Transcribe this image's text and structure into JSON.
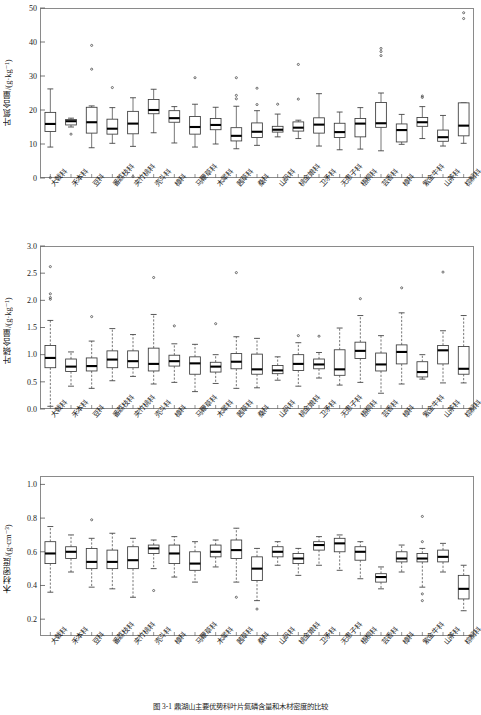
{
  "figure": {
    "caption": "图 3-1  鼎湖山主要优势科叶片氮磷含量和木材密度的比较",
    "categories": [
      "大戟科",
      "禾本科",
      "豆科",
      "番荔枝科",
      "夹竹桃科",
      "壳斗科",
      "樟科",
      "马鞭草科",
      "木犀科",
      "茜草科",
      "桑科",
      "山矾科",
      "桃金娘科",
      "卫矛科",
      "无患子科",
      "梧桐科",
      "芸香科",
      "樟科",
      "紫金牛科",
      "山茶科",
      "棕榈科"
    ]
  },
  "chart_data": [
    {
      "type": "boxplot",
      "panel": "a",
      "title": "",
      "xlabel": "",
      "ylabel": "叶氮含量/(g·kg⁻¹)",
      "ylim": [
        0,
        50
      ],
      "yticks": [
        0,
        10,
        20,
        30,
        40,
        50
      ],
      "ytick_labels": [
        "0",
        "10",
        "20",
        "30",
        "40",
        "50"
      ],
      "grid": false,
      "categories": [
        "大戟科",
        "禾本科",
        "豆科",
        "番荔枝科",
        "夹竹桃科",
        "壳斗科",
        "樟科",
        "马鞭草科",
        "木犀科",
        "茜草科",
        "桑科",
        "山矾科",
        "桃金娘科",
        "卫矛科",
        "无患子科",
        "梧桐科",
        "芸香科",
        "樟科",
        "紫金牛科",
        "山茶科",
        "棕榈科"
      ],
      "boxes": [
        {
          "category": "大戟科",
          "whisker_low": 9.1,
          "q1": 13.7,
          "median": 15.9,
          "q3": 19.3,
          "whisker_high": 26.2,
          "outliers": [
            0.1
          ]
        },
        {
          "category": "禾本科",
          "whisker_low": 15.0,
          "q1": 15.6,
          "median": 16.7,
          "q3": 17.2,
          "whisker_high": 17.6,
          "outliers": [
            12.9
          ]
        },
        {
          "category": "豆科",
          "whisker_low": 8.9,
          "q1": 13.2,
          "median": 16.4,
          "q3": 20.8,
          "whisker_high": 21.2,
          "outliers": [
            39.0,
            32.0
          ]
        },
        {
          "category": "番荔枝科",
          "whisker_low": 10.2,
          "q1": 12.9,
          "median": 14.5,
          "q3": 17.3,
          "whisker_high": 20.7,
          "outliers": [
            26.6
          ]
        },
        {
          "category": "夹竹桃科",
          "whisker_low": 9.3,
          "q1": 13.0,
          "median": 16.0,
          "q3": 19.6,
          "whisker_high": 23.6,
          "outliers": [
            0.4
          ]
        },
        {
          "category": "壳斗科",
          "whisker_low": 13.3,
          "q1": 18.9,
          "median": 20.0,
          "q3": 23.1,
          "whisker_high": 26.1,
          "outliers": []
        },
        {
          "category": "樟科",
          "whisker_low": 10.3,
          "q1": 16.4,
          "median": 17.6,
          "q3": 19.8,
          "whisker_high": 21.0,
          "outliers": []
        },
        {
          "category": "马鞭草科",
          "whisker_low": 9.1,
          "q1": 12.9,
          "median": 15.0,
          "q3": 18.1,
          "whisker_high": 21.7,
          "outliers": [
            29.5
          ]
        },
        {
          "category": "木犀科",
          "whisker_low": 10.0,
          "q1": 14.2,
          "median": 15.6,
          "q3": 17.5,
          "whisker_high": 20.8,
          "outliers": []
        },
        {
          "category": "茜草科",
          "whisker_low": 8.6,
          "q1": 10.9,
          "median": 12.4,
          "q3": 14.8,
          "whisker_high": 21.1,
          "outliers": [
            29.5,
            24.3,
            23.3
          ]
        },
        {
          "category": "桑科",
          "whisker_low": 9.6,
          "q1": 11.9,
          "median": 13.6,
          "q3": 16.2,
          "whisker_high": 19.8,
          "outliers": [
            26.4,
            21.6
          ]
        },
        {
          "category": "山矾科",
          "whisker_low": 12.1,
          "q1": 13.5,
          "median": 14.2,
          "q3": 15.2,
          "whisker_high": 18.8,
          "outliers": [
            21.7
          ]
        },
        {
          "category": "桃金娘科",
          "whisker_low": 11.6,
          "q1": 13.8,
          "median": 14.8,
          "q3": 16.5,
          "whisker_high": 17.0,
          "outliers": [
            33.4,
            23.2
          ]
        },
        {
          "category": "卫矛科",
          "whisker_low": 9.4,
          "q1": 13.2,
          "median": 15.7,
          "q3": 17.7,
          "whisker_high": 24.8,
          "outliers": []
        },
        {
          "category": "无患子科",
          "whisker_low": 8.3,
          "q1": 11.9,
          "median": 13.5,
          "q3": 16.1,
          "whisker_high": 19.4,
          "outliers": []
        },
        {
          "category": "梧桐科",
          "whisker_low": 8.5,
          "q1": 12.1,
          "median": 16.0,
          "q3": 17.5,
          "whisker_high": 20.7,
          "outliers": []
        },
        {
          "category": "芸香科",
          "whisker_low": 8.0,
          "q1": 14.9,
          "median": 16.1,
          "q3": 22.2,
          "whisker_high": 25.0,
          "outliers": [
            38.1,
            37.2,
            36.0
          ]
        },
        {
          "category": "樟科",
          "whisker_low": 9.9,
          "q1": 10.6,
          "median": 14.1,
          "q3": 15.9,
          "whisker_high": 18.7,
          "outliers": []
        },
        {
          "category": "紫金牛科",
          "whisker_low": 11.6,
          "q1": 15.2,
          "median": 16.4,
          "q3": 17.8,
          "whisker_high": 21.0,
          "outliers": [
            24.1,
            23.7
          ]
        },
        {
          "category": "山茶科",
          "whisker_low": 9.4,
          "q1": 10.8,
          "median": 12.0,
          "q3": 14.1,
          "whisker_high": 18.4,
          "outliers": []
        },
        {
          "category": "棕榈科",
          "whisker_low": 10.2,
          "q1": 12.4,
          "median": 15.4,
          "q3": 22.1,
          "whisker_high": 22.1,
          "outliers": [
            48.6,
            46.9
          ]
        }
      ]
    },
    {
      "type": "boxplot",
      "panel": "b",
      "title": "",
      "xlabel": "",
      "ylabel": "叶磷含量/(g·kg⁻¹)",
      "ylim": [
        0.0,
        3.0
      ],
      "yticks": [
        0.0,
        0.5,
        1.0,
        1.5,
        2.0,
        2.5,
        3.0
      ],
      "ytick_labels": [
        "0.0",
        "0.5",
        "1.0",
        "1.5",
        "2.0",
        "2.5",
        "3.0"
      ],
      "grid": false,
      "categories": [
        "大戟科",
        "禾本科",
        "豆科",
        "番荔枝科",
        "夹竹桃科",
        "壳斗科",
        "樟科",
        "马鞭草科",
        "木犀科",
        "茜草科",
        "桑科",
        "山矾科",
        "桃金娘科",
        "卫矛科",
        "无患子科",
        "梧桐科",
        "芸香科",
        "樟科",
        "紫金牛科",
        "山茶科",
        "棕榈科"
      ],
      "boxes": [
        {
          "category": "大戟科",
          "whisker_low": 0.05,
          "q1": 0.76,
          "median": 0.94,
          "q3": 1.17,
          "whisker_high": 1.63,
          "outliers": [
            2.62,
            2.12,
            2.05,
            2.02
          ]
        },
        {
          "category": "禾本科",
          "whisker_low": 0.42,
          "q1": 0.69,
          "median": 0.78,
          "q3": 0.92,
          "whisker_high": 1.05,
          "outliers": []
        },
        {
          "category": "豆科",
          "whisker_low": 0.38,
          "q1": 0.7,
          "median": 0.79,
          "q3": 0.94,
          "whisker_high": 1.25,
          "outliers": [
            1.7
          ]
        },
        {
          "category": "番荔枝科",
          "whisker_low": 0.52,
          "q1": 0.76,
          "median": 0.91,
          "q3": 1.07,
          "whisker_high": 1.48,
          "outliers": []
        },
        {
          "category": "夹竹桃科",
          "whisker_low": 0.6,
          "q1": 0.76,
          "median": 0.88,
          "q3": 1.07,
          "whisker_high": 1.37,
          "outliers": []
        },
        {
          "category": "壳斗科",
          "whisker_low": 0.46,
          "q1": 0.7,
          "median": 0.83,
          "q3": 1.12,
          "whisker_high": 1.74,
          "outliers": [
            2.42
          ]
        },
        {
          "category": "樟科",
          "whisker_low": 0.49,
          "q1": 0.79,
          "median": 0.88,
          "q3": 0.99,
          "whisker_high": 1.2,
          "outliers": [
            1.53
          ]
        },
        {
          "category": "马鞭草科",
          "whisker_low": 0.32,
          "q1": 0.64,
          "median": 0.84,
          "q3": 0.96,
          "whisker_high": 1.19,
          "outliers": []
        },
        {
          "category": "木犀科",
          "whisker_low": 0.47,
          "q1": 0.68,
          "median": 0.78,
          "q3": 0.86,
          "whisker_high": 1.0,
          "outliers": [
            1.57
          ]
        },
        {
          "category": "茜草科",
          "whisker_low": 0.38,
          "q1": 0.74,
          "median": 0.87,
          "q3": 1.02,
          "whisker_high": 1.33,
          "outliers": [
            2.51
          ]
        },
        {
          "category": "桑科",
          "whisker_low": 0.39,
          "q1": 0.64,
          "median": 0.73,
          "q3": 1.01,
          "whisker_high": 1.3,
          "outliers": []
        },
        {
          "category": "山矾科",
          "whisker_low": 0.53,
          "q1": 0.65,
          "median": 0.71,
          "q3": 0.8,
          "whisker_high": 0.96,
          "outliers": []
        },
        {
          "category": "桃金娘科",
          "whisker_low": 0.42,
          "q1": 0.71,
          "median": 0.83,
          "q3": 1.0,
          "whisker_high": 1.22,
          "outliers": [
            1.35
          ]
        },
        {
          "category": "卫矛科",
          "whisker_low": 0.57,
          "q1": 0.74,
          "median": 0.82,
          "q3": 0.92,
          "whisker_high": 1.04,
          "outliers": [
            1.34
          ]
        },
        {
          "category": "无患子科",
          "whisker_low": 0.44,
          "q1": 0.62,
          "median": 0.73,
          "q3": 1.09,
          "whisker_high": 1.49,
          "outliers": []
        },
        {
          "category": "梧桐科",
          "whisker_low": 0.49,
          "q1": 0.93,
          "median": 1.07,
          "q3": 1.23,
          "whisker_high": 1.72,
          "outliers": [
            2.03
          ]
        },
        {
          "category": "芸香科",
          "whisker_low": 0.29,
          "q1": 0.7,
          "median": 0.82,
          "q3": 1.03,
          "whisker_high": 1.35,
          "outliers": []
        },
        {
          "category": "樟科",
          "whisker_low": 0.46,
          "q1": 0.83,
          "median": 1.05,
          "q3": 1.18,
          "whisker_high": 1.77,
          "outliers": [
            2.23
          ]
        },
        {
          "category": "紫金牛科",
          "whisker_low": 0.55,
          "q1": 0.59,
          "median": 0.68,
          "q3": 0.87,
          "whisker_high": 1.0,
          "outliers": []
        },
        {
          "category": "山茶科",
          "whisker_low": 0.48,
          "q1": 0.83,
          "median": 1.08,
          "q3": 1.17,
          "whisker_high": 1.44,
          "outliers": [
            2.52
          ]
        },
        {
          "category": "棕榈科",
          "whisker_low": 0.48,
          "q1": 0.64,
          "median": 0.74,
          "q3": 1.15,
          "whisker_high": 1.72,
          "outliers": []
        }
      ]
    },
    {
      "type": "boxplot",
      "panel": "c",
      "title": "",
      "xlabel": "",
      "ylabel": "木材密度/(g·cm⁻³)",
      "ylim": [
        0.1,
        1.05
      ],
      "yticks": [
        0.2,
        0.4,
        0.6,
        0.8,
        1.0
      ],
      "ytick_labels": [
        "0.2",
        "0.4",
        "0.6",
        "0.8",
        "1.0"
      ],
      "grid": false,
      "categories": [
        "大戟科",
        "禾本科",
        "豆科",
        "番荔枝科",
        "夹竹桃科",
        "壳斗科",
        "樟科",
        "马鞭草科",
        "木犀科",
        "茜草科",
        "桑科",
        "山矾科",
        "桃金娘科",
        "卫矛科",
        "无患子科",
        "梧桐科",
        "芸香科",
        "樟科",
        "紫金牛科",
        "山茶科",
        "棕榈科"
      ],
      "boxes": [
        {
          "category": "大戟科",
          "whisker_low": 0.36,
          "q1": 0.53,
          "median": 0.59,
          "q3": 0.66,
          "whisker_high": 0.75,
          "outliers": []
        },
        {
          "category": "禾本科",
          "whisker_low": 0.48,
          "q1": 0.56,
          "median": 0.6,
          "q3": 0.63,
          "whisker_high": 0.7,
          "outliers": []
        },
        {
          "category": "豆科",
          "whisker_low": 0.39,
          "q1": 0.5,
          "median": 0.54,
          "q3": 0.62,
          "whisker_high": 0.68,
          "outliers": [
            0.79
          ]
        },
        {
          "category": "番荔枝科",
          "whisker_low": 0.38,
          "q1": 0.5,
          "median": 0.54,
          "q3": 0.61,
          "whisker_high": 0.71,
          "outliers": []
        },
        {
          "category": "夹竹桃科",
          "whisker_low": 0.33,
          "q1": 0.5,
          "median": 0.55,
          "q3": 0.63,
          "whisker_high": 0.68,
          "outliers": []
        },
        {
          "category": "壳斗科",
          "whisker_low": 0.5,
          "q1": 0.59,
          "median": 0.62,
          "q3": 0.64,
          "whisker_high": 0.67,
          "outliers": [
            0.37
          ]
        },
        {
          "category": "樟科",
          "whisker_low": 0.45,
          "q1": 0.53,
          "median": 0.59,
          "q3": 0.64,
          "whisker_high": 0.69,
          "outliers": []
        },
        {
          "category": "马鞭草科",
          "whisker_low": 0.42,
          "q1": 0.49,
          "median": 0.53,
          "q3": 0.6,
          "whisker_high": 0.66,
          "outliers": []
        },
        {
          "category": "木犀科",
          "whisker_low": 0.51,
          "q1": 0.57,
          "median": 0.6,
          "q3": 0.64,
          "whisker_high": 0.67,
          "outliers": []
        },
        {
          "category": "茜草科",
          "whisker_low": 0.42,
          "q1": 0.56,
          "median": 0.61,
          "q3": 0.67,
          "whisker_high": 0.74,
          "outliers": [
            0.33
          ]
        },
        {
          "category": "桑科",
          "whisker_low": 0.31,
          "q1": 0.43,
          "median": 0.5,
          "q3": 0.57,
          "whisker_high": 0.62,
          "outliers": [
            0.26
          ]
        },
        {
          "category": "山矾科",
          "whisker_low": 0.52,
          "q1": 0.57,
          "median": 0.6,
          "q3": 0.63,
          "whisker_high": 0.66,
          "outliers": []
        },
        {
          "category": "桃金娘科",
          "whisker_low": 0.46,
          "q1": 0.53,
          "median": 0.56,
          "q3": 0.59,
          "whisker_high": 0.62,
          "outliers": []
        },
        {
          "category": "卫矛科",
          "whisker_low": 0.52,
          "q1": 0.61,
          "median": 0.64,
          "q3": 0.66,
          "whisker_high": 0.69,
          "outliers": []
        },
        {
          "category": "无患子科",
          "whisker_low": 0.49,
          "q1": 0.6,
          "median": 0.65,
          "q3": 0.68,
          "whisker_high": 0.7,
          "outliers": []
        },
        {
          "category": "梧桐科",
          "whisker_low": 0.44,
          "q1": 0.55,
          "median": 0.6,
          "q3": 0.63,
          "whisker_high": 0.66,
          "outliers": []
        },
        {
          "category": "芸香科",
          "whisker_low": 0.38,
          "q1": 0.42,
          "median": 0.45,
          "q3": 0.47,
          "whisker_high": 0.51,
          "outliers": []
        },
        {
          "category": "樟科",
          "whisker_low": 0.48,
          "q1": 0.54,
          "median": 0.56,
          "q3": 0.6,
          "whisker_high": 0.64,
          "outliers": []
        },
        {
          "category": "紫金牛科",
          "whisker_low": 0.39,
          "q1": 0.54,
          "median": 0.56,
          "q3": 0.59,
          "whisker_high": 0.62,
          "outliers": [
            0.81,
            0.66,
            0.35,
            0.31
          ]
        },
        {
          "category": "山茶科",
          "whisker_low": 0.48,
          "q1": 0.54,
          "median": 0.57,
          "q3": 0.61,
          "whisker_high": 0.65,
          "outliers": []
        },
        {
          "category": "棕榈科",
          "whisker_low": 0.25,
          "q1": 0.32,
          "median": 0.38,
          "q3": 0.46,
          "whisker_high": 0.52,
          "outliers": []
        }
      ]
    }
  ]
}
